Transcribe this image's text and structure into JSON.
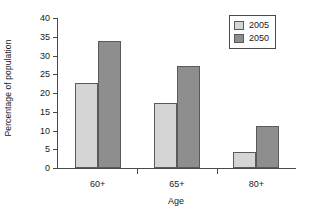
{
  "chart_data": {
    "type": "bar",
    "title": "",
    "xlabel": "Age",
    "ylabel": "Percentage of population",
    "categories": [
      "60+",
      "65+",
      "80+"
    ],
    "series": [
      {
        "name": "2005",
        "values": [
          22.8,
          17.3,
          4.2
        ],
        "color": "#d5d5d5"
      },
      {
        "name": "2050",
        "values": [
          34.0,
          27.3,
          11.1
        ],
        "color": "#8e8e8e"
      }
    ],
    "ylim": [
      0,
      40
    ],
    "ytick_values": [
      0,
      5,
      10,
      15,
      20,
      25,
      30,
      35,
      40
    ],
    "ytick_labels": [
      "0",
      "5",
      "10",
      "15",
      "20",
      "25",
      "30",
      "35",
      "40"
    ],
    "grid": false,
    "legend_position": "top-right",
    "axis_color": "#4a4a4a",
    "bar_edge_color": "#5a5a5a"
  },
  "legend": {
    "entries": [
      {
        "label": "2005"
      },
      {
        "label": "2050"
      }
    ]
  }
}
